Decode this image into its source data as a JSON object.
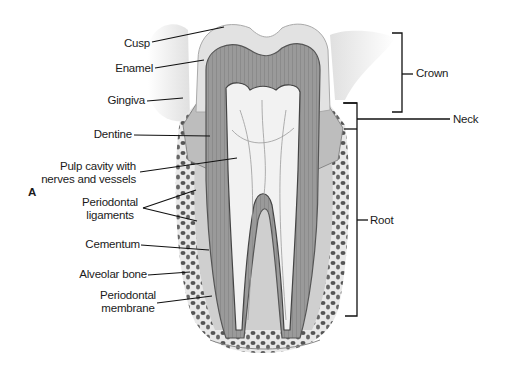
{
  "figure": {
    "panel_label": "A",
    "left_labels": [
      {
        "id": "cusp",
        "text": "Cusp"
      },
      {
        "id": "enamel",
        "text": "Enamel"
      },
      {
        "id": "gingiva",
        "text": "Gingiva"
      },
      {
        "id": "dentine",
        "text": "Dentine"
      },
      {
        "id": "pulp",
        "line1": "Pulp cavity with",
        "line2": "nerves and vessels"
      },
      {
        "id": "ligaments",
        "line1": "Periodontal",
        "line2": "ligaments"
      },
      {
        "id": "cementum",
        "text": "Cementum"
      },
      {
        "id": "alveolar",
        "text": "Alveolar bone"
      },
      {
        "id": "membrane",
        "line1": "Periodontal",
        "line2": "membrane"
      }
    ],
    "right_labels": [
      {
        "id": "crown",
        "text": "Crown"
      },
      {
        "id": "neck",
        "text": "Neck"
      },
      {
        "id": "root",
        "text": "Root"
      }
    ]
  }
}
